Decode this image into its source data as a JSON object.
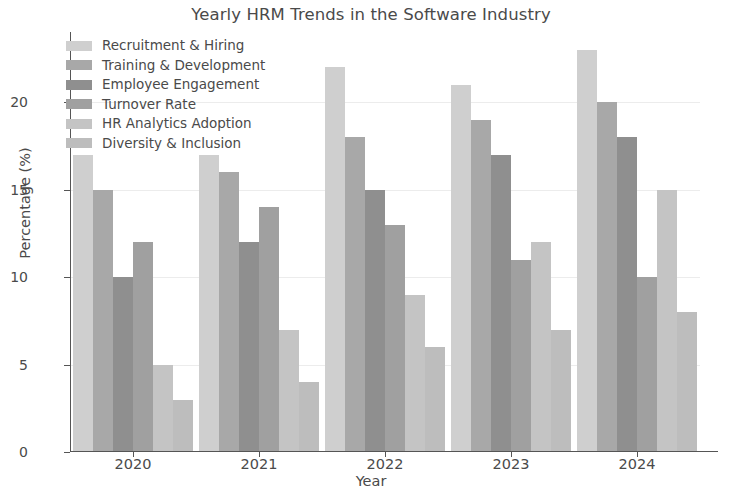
{
  "chart_data": {
    "type": "bar",
    "title": "Yearly HRM Trends in the Software Industry",
    "xlabel": "Year",
    "ylabel": "Percentage (%)",
    "categories": [
      "2020",
      "2021",
      "2022",
      "2023",
      "2024"
    ],
    "ylim": [
      0,
      24
    ],
    "yticks": [
      0,
      5,
      10,
      15,
      20
    ],
    "ytick_labels": [
      "0",
      "5",
      "10",
      "15",
      "20"
    ],
    "grid": true,
    "legend_position": "upper left",
    "series": [
      {
        "name": "Recruitment & Hiring",
        "color": "#cfcfcf",
        "values": [
          17,
          17,
          22,
          21,
          23
        ]
      },
      {
        "name": "Training & Development",
        "color": "#a8a8a8",
        "values": [
          15,
          16,
          18,
          19,
          20
        ]
      },
      {
        "name": "Employee Engagement",
        "color": "#8f8f8f",
        "values": [
          10,
          12,
          15,
          17,
          18
        ]
      },
      {
        "name": "Turnover Rate",
        "color": "#a0a0a0",
        "values": [
          12,
          14,
          13,
          11,
          10
        ]
      },
      {
        "name": "HR Analytics Adoption",
        "color": "#c4c4c4",
        "values": [
          5,
          7,
          9,
          12,
          15
        ]
      },
      {
        "name": "Diversity & Inclusion",
        "color": "#bdbdbd",
        "values": [
          3,
          4,
          6,
          7,
          8
        ]
      }
    ]
  }
}
